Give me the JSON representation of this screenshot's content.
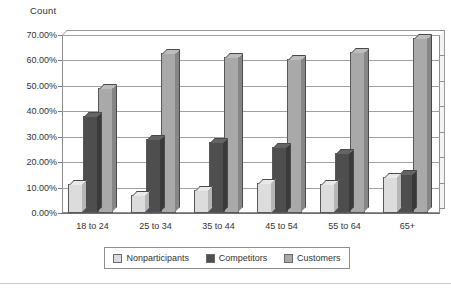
{
  "chart_data": {
    "type": "bar",
    "title": "Count",
    "xlabel": "",
    "ylabel": "Count",
    "ylim": [
      0,
      70
    ],
    "grid": true,
    "legend_position": "bottom",
    "y_ticks": [
      "0.00%",
      "10.00%",
      "20.00%",
      "30.00%",
      "40.00%",
      "50.00%",
      "60.00%",
      "70.00%"
    ],
    "y_tick_values": [
      0,
      10,
      20,
      30,
      40,
      50,
      60,
      70
    ],
    "categories": [
      "18 to 24",
      "25 to 34",
      "35 to 44",
      "45 to 54",
      "55 to 64",
      "65+"
    ],
    "series": [
      {
        "name": "Nonparticipants",
        "color": "#dcdcdc",
        "values": [
          11.5,
          7.0,
          9.0,
          12.0,
          11.5,
          14.0
        ]
      },
      {
        "name": "Competitors",
        "color": "#4e4e4e",
        "values": [
          38.0,
          29.0,
          28.0,
          26.0,
          23.5,
          15.5
        ]
      },
      {
        "name": "Customers",
        "color": "#a9a9a9",
        "values": [
          49.0,
          63.0,
          61.5,
          60.5,
          63.5,
          69.0
        ]
      }
    ],
    "units": "percent"
  },
  "colors": {
    "nonparticipants": "#dcdcdc",
    "competitors": "#4e4e4e",
    "customers": "#a9a9a9",
    "axis": "#8d8d8d",
    "grid": "#a0a0a0",
    "text": "#333333"
  }
}
